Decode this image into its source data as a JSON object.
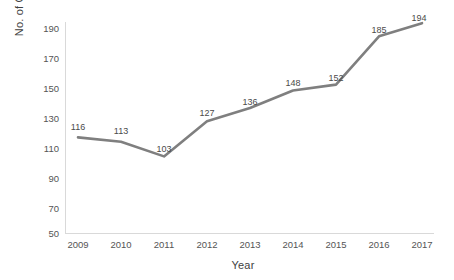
{
  "chart_data": {
    "type": "line",
    "title": "",
    "xlabel": "Year",
    "ylabel": "No. of Committees",
    "categories": [
      "2009",
      "2010",
      "2011",
      "2012",
      "2013",
      "2014",
      "2015",
      "2016",
      "2017"
    ],
    "values": [
      116,
      113,
      103,
      127,
      136,
      148,
      152,
      185,
      194
    ],
    "point_labels": [
      "116",
      "113",
      "103",
      "127",
      "136",
      "148",
      "152",
      "185",
      "194"
    ],
    "ylim": [
      50,
      190
    ],
    "ytick_labels": [
      "190",
      "170",
      "150",
      "130",
      "110",
      "90",
      "70",
      "50"
    ],
    "ytick_values": [
      190,
      170,
      150,
      130,
      110,
      90,
      70,
      50
    ],
    "grid": false,
    "legend": "none",
    "series_color": "#7f7f7f",
    "axis_color": "#d9d9d9",
    "text_color": "#4a4a4a",
    "background": "#ffffff"
  }
}
